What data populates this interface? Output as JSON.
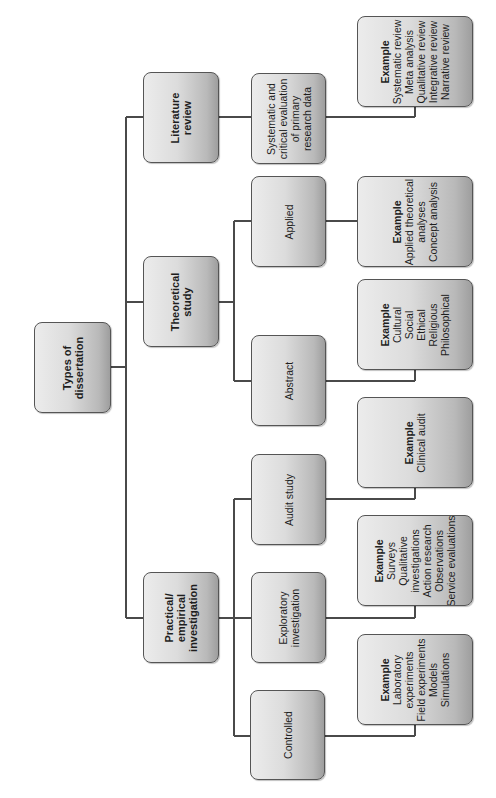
{
  "diagram": {
    "title": "Types of dissertation",
    "root": {
      "lines": [
        "Types of",
        "dissertation"
      ]
    },
    "categories": [
      {
        "id": "literature-review",
        "lines": [
          "Literature",
          "review"
        ],
        "children": [
          {
            "id": "lit-sub",
            "lines": [
              "Systematic and",
              "critical evaluation",
              "of primary",
              "research data"
            ],
            "example": {
              "title": "Example",
              "items": [
                "Systematic review",
                "Meta analysis",
                "Qualitative review",
                "Integrative review",
                "Narrative review"
              ]
            }
          }
        ]
      },
      {
        "id": "theoretical-study",
        "lines": [
          "Theoretical",
          "study"
        ],
        "children": [
          {
            "id": "applied",
            "lines": [
              "Applied"
            ],
            "example": {
              "title": "Example",
              "items": [
                "Applied theoretical",
                "analyses",
                "Concept analysis"
              ]
            }
          },
          {
            "id": "abstract",
            "lines": [
              "Abstract"
            ],
            "example": {
              "title": "Example",
              "items": [
                "Cultural",
                "Social",
                "Ethical",
                "Religious",
                "Philosophical"
              ]
            }
          }
        ]
      },
      {
        "id": "practical-empirical",
        "lines": [
          "Practical/",
          "empirical",
          "investigation"
        ],
        "children": [
          {
            "id": "audit-study",
            "lines": [
              "Audit study"
            ],
            "example": {
              "title": "Example",
              "items": [
                "Clinical audit"
              ]
            }
          },
          {
            "id": "exploratory",
            "lines": [
              "Exploratory",
              "investigation"
            ],
            "example": {
              "title": "Example",
              "items": [
                "Surveys",
                "Qualitative",
                "investigations",
                "Action research",
                "Observations",
                "Service evaluations"
              ]
            }
          },
          {
            "id": "controlled",
            "lines": [
              "Controlled"
            ],
            "example": {
              "title": "Example",
              "items": [
                "Laboratory",
                "experiments",
                "Field experiments",
                "Models",
                "Simulations"
              ]
            }
          }
        ]
      }
    ],
    "colors": {
      "box_border": "#555555",
      "box_fill_light": "#ececec",
      "box_fill_dark": "#9e9e9e",
      "connector": "#4a4a4a",
      "text": "#1e1e1e"
    }
  }
}
